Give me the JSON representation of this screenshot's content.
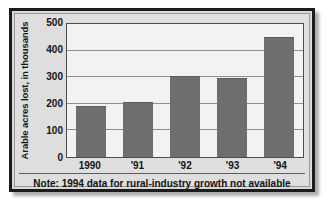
{
  "chart_data": {
    "type": "bar",
    "title": "",
    "subtitle": "",
    "xlabel": "",
    "ylabel": "Arable acres lost, in thousands",
    "categories": [
      "1990",
      "'91",
      "'92",
      "'93",
      "'94"
    ],
    "values": [
      190,
      205,
      305,
      298,
      450
    ],
    "ylim": [
      0,
      500
    ],
    "yticks": [
      "0",
      "100",
      "200",
      "300",
      "400",
      "500"
    ],
    "ytick_values": [
      0,
      100,
      200,
      300,
      400,
      500
    ],
    "grid": "horizontal",
    "legend": "none",
    "series": [
      {
        "name": "Arable acres lost",
        "values": [
          190,
          205,
          305,
          298,
          450
        ]
      }
    ],
    "annotations": [
      "Note: 1994 data for rural-industry growth not available"
    ],
    "colors": {
      "bar_fill": "#6e6e6e",
      "plot_background": "#f2f2f2",
      "panel_background": "#dedede",
      "gridline": "#8d8d8d",
      "axis_line": "#4c4c4c",
      "frame": "#1b1b1b",
      "text": "#141414"
    }
  },
  "note": {
    "text": "Note: 1994 data for rural-industry growth not available"
  }
}
